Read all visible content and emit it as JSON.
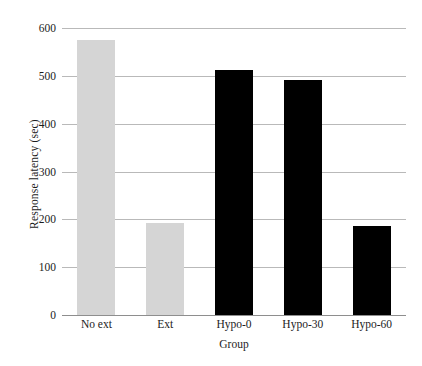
{
  "chart_data": {
    "type": "bar",
    "title": "",
    "xlabel": "Group",
    "ylabel": "Response latency (sec)",
    "categories": [
      "No ext",
      "Ext",
      "Hypo-0",
      "Hypo-30",
      "Hypo-60"
    ],
    "values": [
      575,
      193,
      512,
      492,
      186
    ],
    "bar_colors": [
      "#d5d5d5",
      "#d5d5d5",
      "#000000",
      "#000000",
      "#000000"
    ],
    "ylim": [
      0,
      600
    ],
    "yticks": [
      0,
      100,
      200,
      300,
      400,
      500,
      600
    ],
    "ytick_labels": [
      "0",
      "100",
      "200",
      "300",
      "400",
      "500",
      "600"
    ],
    "grid": true,
    "grid_axis": "y",
    "legend": "none",
    "background": "#ffffff",
    "grid_color": "#b9b9b9",
    "axis_color": "#8e8e8e"
  }
}
